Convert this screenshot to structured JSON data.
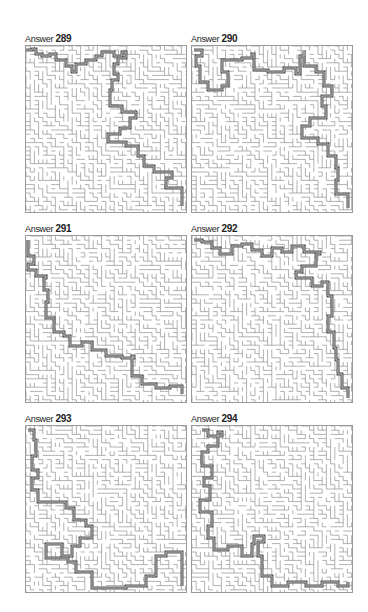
{
  "page": {
    "panels": [
      {
        "label_prefix": "Answer",
        "number": "289",
        "seed": 289
      },
      {
        "label_prefix": "Answer",
        "number": "290",
        "seed": 290
      },
      {
        "label_prefix": "Answer",
        "number": "291",
        "seed": 291
      },
      {
        "label_prefix": "Answer",
        "number": "292",
        "seed": 292
      },
      {
        "label_prefix": "Answer",
        "number": "293",
        "seed": 293
      },
      {
        "label_prefix": "Answer",
        "number": "294",
        "seed": 294
      }
    ],
    "paths": [
      [
        [
          0,
          4
        ],
        [
          6,
          3
        ],
        [
          10,
          8
        ],
        [
          16,
          10
        ],
        [
          24,
          8
        ],
        [
          30,
          14
        ],
        [
          40,
          20
        ],
        [
          46,
          26
        ],
        [
          50,
          18
        ],
        [
          60,
          14
        ],
        [
          70,
          10
        ],
        [
          76,
          6
        ],
        [
          88,
          10
        ],
        [
          96,
          6
        ],
        [
          100,
          12
        ],
        [
          92,
          18
        ],
        [
          88,
          28
        ],
        [
          92,
          34
        ],
        [
          86,
          44
        ],
        [
          84,
          60
        ],
        [
          96,
          66
        ],
        [
          110,
          72
        ],
        [
          104,
          82
        ],
        [
          94,
          88
        ],
        [
          82,
          96
        ],
        [
          100,
          100
        ],
        [
          112,
          110
        ],
        [
          118,
          120
        ],
        [
          128,
          126
        ],
        [
          146,
          132
        ],
        [
          140,
          142
        ],
        [
          156,
          146
        ],
        [
          156,
          160
        ]
      ],
      [
        [
          2,
          4
        ],
        [
          10,
          10
        ],
        [
          4,
          20
        ],
        [
          8,
          36
        ],
        [
          16,
          44
        ],
        [
          30,
          40
        ],
        [
          36,
          26
        ],
        [
          30,
          14
        ],
        [
          50,
          12
        ],
        [
          60,
          8
        ],
        [
          62,
          24
        ],
        [
          76,
          26
        ],
        [
          92,
          22
        ],
        [
          104,
          28
        ],
        [
          108,
          10
        ],
        [
          112,
          4
        ],
        [
          112,
          20
        ],
        [
          124,
          26
        ],
        [
          132,
          40
        ],
        [
          140,
          50
        ],
        [
          130,
          60
        ],
        [
          134,
          72
        ],
        [
          118,
          80
        ],
        [
          110,
          92
        ],
        [
          126,
          98
        ],
        [
          136,
          110
        ],
        [
          144,
          122
        ],
        [
          146,
          134
        ],
        [
          144,
          148
        ],
        [
          156,
          152
        ],
        [
          156,
          162
        ]
      ],
      [
        [
          2,
          4
        ],
        [
          2,
          20
        ],
        [
          8,
          28
        ],
        [
          2,
          34
        ],
        [
          10,
          40
        ],
        [
          20,
          42
        ],
        [
          18,
          54
        ],
        [
          22,
          66
        ],
        [
          20,
          82
        ],
        [
          28,
          96
        ],
        [
          38,
          100
        ],
        [
          44,
          110
        ],
        [
          56,
          106
        ],
        [
          66,
          114
        ],
        [
          80,
          120
        ],
        [
          96,
          122
        ],
        [
          108,
          120
        ],
        [
          106,
          140
        ],
        [
          116,
          148
        ],
        [
          130,
          152
        ],
        [
          144,
          150
        ],
        [
          156,
          158
        ]
      ],
      [
        [
          2,
          4
        ],
        [
          10,
          6
        ],
        [
          20,
          12
        ],
        [
          28,
          18
        ],
        [
          40,
          10
        ],
        [
          50,
          8
        ],
        [
          60,
          14
        ],
        [
          70,
          20
        ],
        [
          80,
          12
        ],
        [
          90,
          16
        ],
        [
          100,
          10
        ],
        [
          112,
          16
        ],
        [
          128,
          18
        ],
        [
          124,
          30
        ],
        [
          110,
          36
        ],
        [
          104,
          42
        ],
        [
          120,
          50
        ],
        [
          130,
          46
        ],
        [
          136,
          60
        ],
        [
          140,
          80
        ],
        [
          136,
          96
        ],
        [
          142,
          112
        ],
        [
          144,
          124
        ],
        [
          146,
          138
        ],
        [
          150,
          152
        ],
        [
          156,
          162
        ]
      ],
      [
        [
          2,
          4
        ],
        [
          8,
          14
        ],
        [
          10,
          30
        ],
        [
          6,
          44
        ],
        [
          12,
          52
        ],
        [
          6,
          64
        ],
        [
          12,
          76
        ],
        [
          40,
          82
        ],
        [
          48,
          94
        ],
        [
          60,
          100
        ],
        [
          66,
          112
        ],
        [
          54,
          120
        ],
        [
          46,
          130
        ],
        [
          36,
          118
        ],
        [
          20,
          132
        ],
        [
          42,
          136
        ],
        [
          50,
          146
        ],
        [
          66,
          162
        ],
        [
          100,
          160
        ],
        [
          120,
          150
        ],
        [
          130,
          130
        ],
        [
          140,
          126
        ],
        [
          156,
          142
        ],
        [
          156,
          160
        ]
      ],
      [
        [
          10,
          4
        ],
        [
          16,
          10
        ],
        [
          30,
          6
        ],
        [
          26,
          20
        ],
        [
          16,
          26
        ],
        [
          10,
          40
        ],
        [
          20,
          52
        ],
        [
          12,
          60
        ],
        [
          18,
          74
        ],
        [
          8,
          86
        ],
        [
          20,
          100
        ],
        [
          16,
          112
        ],
        [
          22,
          124
        ],
        [
          36,
          120
        ],
        [
          50,
          130
        ],
        [
          60,
          118
        ],
        [
          62,
          110
        ],
        [
          72,
          116
        ],
        [
          66,
          130
        ],
        [
          70,
          150
        ],
        [
          80,
          160
        ],
        [
          96,
          156
        ],
        [
          114,
          160
        ],
        [
          130,
          156
        ],
        [
          146,
          160
        ],
        [
          156,
          156
        ]
      ]
    ]
  }
}
